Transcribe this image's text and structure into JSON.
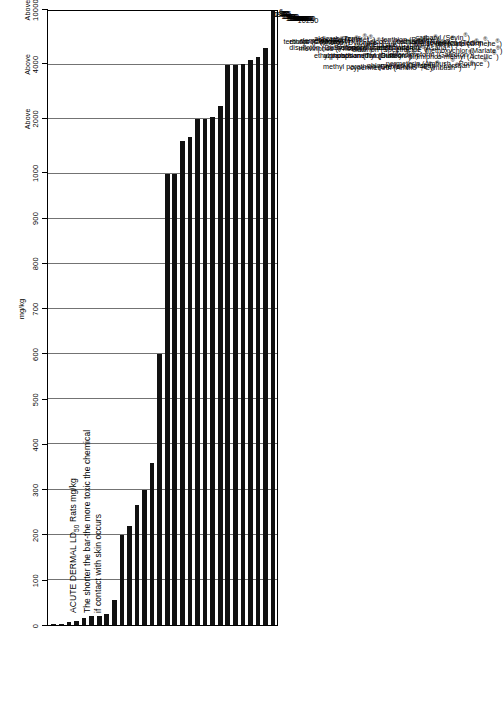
{
  "chart_data": {
    "type": "bar",
    "orientation": "horizontal",
    "title": "ACUTE DERMAL LD50 Rats mg/kg",
    "title_line1_pre": "ACUTE DERMAL LD",
    "title_line1_sub": "50",
    "title_line1_post": " Rats mg/kg",
    "subtitle_line1": "The shorter the bar-the more toxic the chemical",
    "subtitle_line2": "if contact with skin occurs",
    "xlabel": "mg/kg",
    "ylabel": "",
    "grid": true,
    "legend": false,
    "axis_ticks": [
      {
        "label": "0",
        "above": ""
      },
      {
        "label": "100",
        "above": ""
      },
      {
        "label": "200",
        "above": ""
      },
      {
        "label": "300",
        "above": ""
      },
      {
        "label": "400",
        "above": ""
      },
      {
        "label": "500",
        "above": ""
      },
      {
        "label": "600",
        "above": ""
      },
      {
        "label": "700",
        "above": ""
      },
      {
        "label": "800",
        "above": ""
      },
      {
        "label": "900",
        "above": ""
      },
      {
        "label": "1000",
        "above": ""
      },
      {
        "label": "2000",
        "above": "Above"
      },
      {
        "label": "4000",
        "above": "Above"
      },
      {
        "label": "10000",
        "above": "Above"
      }
    ],
    "categories": [
      "terbufos (Counter®)",
      "ethoprop (Mocap®)",
      "disulfoton (Di-Syston®)",
      "demeton (Systox®)",
      "mevinphos (Phosdrin®)",
      "aldicarb (Temik®)",
      "phorate (Thimet®)",
      "fonofos (Dyfonate®)",
      "ethyl parathion (Thiophos®)",
      "carbofuran (Furadan®)",
      "azinphos-methyl (Guthion®)",
      "phosphamidon (Dimecron®)",
      "methyl parathion (Drexel M.P. 4E®)",
      "endosulfan (Thiodan®)",
      "diazinon (Spectracide®)",
      "dimethoate (Cygon®)",
      "dicofol (Kelthane®)",
      "cypermethrin (Ammo®, Cymbush®)",
      "fenthion (Baytex®)",
      "esfenvalerate (Asana®)",
      "chlorpyrifos (Dursban®, Lorsban®)",
      "trichlorfon (Dylox®)",
      "chlordimeform (Galecron®)",
      "permethrin (Ambush®, Pounce®)",
      "carbaryl (Sevin®)",
      "malathion (Cythion®)",
      "pirimiphos-methyl (Actellic®)",
      "tetradifon (Tedion®)",
      "methoxychlor (Marlate®)",
      "acephate (Orthene®)"
    ],
    "values": [
      1.1,
      2.4,
      6,
      8.2,
      16,
      20,
      20,
      25,
      55,
      200,
      220,
      267,
      300,
      359,
      600,
      1000,
      1000,
      1600,
      1680,
      2000,
      2000,
      2100,
      2500,
      4000,
      4000,
      4100,
      4592,
      5000,
      6000,
      10250
    ],
    "value_labels": [
      "1.1",
      "2.4",
      "6",
      "8.2",
      "16",
      "20",
      "20",
      "25",
      "55",
      "200",
      "220",
      "267",
      "300",
      "359",
      "600",
      "1000",
      "1000",
      "1600",
      "1680",
      "2000",
      "2000",
      "2100",
      "2500",
      "4000",
      "4000",
      "4100",
      "4592",
      "5000",
      "6000",
      "10250"
    ],
    "xlim": [
      0,
      10250
    ],
    "bar_color": "#111111",
    "grid_color": "#5a5a5a",
    "background": "#ffffff"
  }
}
